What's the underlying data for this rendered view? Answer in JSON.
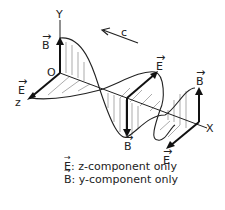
{
  "diagram": {
    "axes": {
      "y": "Y",
      "z": "z",
      "x": "X",
      "origin": "O"
    },
    "propagation_label": "c",
    "vector_labels": {
      "b_top": "B",
      "e_left": "E",
      "e_mid": "E",
      "b_mid": "B",
      "b_right": "B",
      "e_bottom": "E"
    },
    "legend": [
      {
        "symbol": "E",
        "text": ": z-component only"
      },
      {
        "symbol": "B",
        "text": ": y-component only"
      }
    ],
    "colors": {
      "stroke": "#222222",
      "hatch": "#777777",
      "background": "#ffffff"
    }
  }
}
